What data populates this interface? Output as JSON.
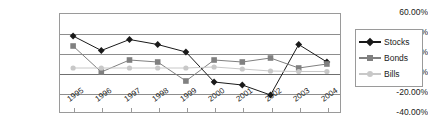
{
  "chart_data": {
    "type": "line",
    "title": "",
    "xlabel": "",
    "ylabel": "",
    "categories": [
      "1995",
      "1996",
      "1997",
      "1998",
      "1999",
      "2000",
      "2001",
      "2002",
      "2003",
      "2004"
    ],
    "ylim": [
      -40,
      60
    ],
    "ytick_labels": [
      "60.00%",
      "40.00%",
      "20.00%",
      "0.00%",
      "-20.00%",
      "-40.00%"
    ],
    "ytick_values": [
      60,
      40,
      20,
      0,
      -20,
      -40
    ],
    "grid": true,
    "legend_position": "right",
    "series": [
      {
        "name": "Stocks",
        "color": "#1a1a1a",
        "marker": "diamond",
        "values": [
          37.0,
          22.5,
          33.5,
          28.5,
          21.0,
          -9.0,
          -12.0,
          -22.0,
          28.5,
          11.0
        ]
      },
      {
        "name": "Bonds",
        "color": "#808080",
        "marker": "square",
        "values": [
          27.0,
          1.0,
          13.0,
          11.0,
          -8.0,
          13.0,
          11.0,
          15.0,
          5.0,
          9.0
        ]
      },
      {
        "name": "Bills",
        "color": "#c8c8c8",
        "marker": "circle",
        "values": [
          5.0,
          5.0,
          5.0,
          5.0,
          5.0,
          6.0,
          4.0,
          2.0,
          1.5,
          1.5
        ]
      }
    ]
  }
}
